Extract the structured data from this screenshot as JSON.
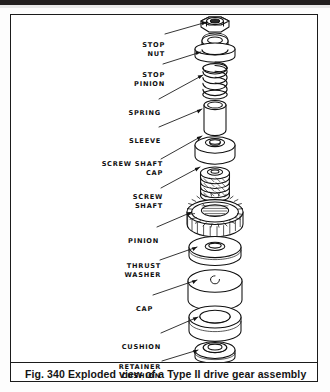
{
  "figure": {
    "caption": "Fig. 340  Exploded view of a Type II drive gear assembly",
    "caption_number": "Fig. 340",
    "caption_text": "Exploded view of a Type II drive gear assembly",
    "border_color": "#1b1b1b",
    "ink_color": "#101010",
    "page_background": "#ffffff",
    "scan_band_color": "#221f1f"
  },
  "callouts": [
    {
      "id": "stop-nut",
      "label": "STOP\nNUT",
      "lines": [
        "STOP",
        "NUT"
      ],
      "label_x": 112,
      "label_y": 14,
      "leader_from_x": 152,
      "leader_from_y": 19,
      "leader_to_x": 196,
      "leader_to_y": 8
    },
    {
      "id": "stop-pinion",
      "label": "STOP\nPINION",
      "lines": [
        "STOP",
        "PINION"
      ],
      "label_x": 104,
      "label_y": 44,
      "leader_from_x": 152,
      "leader_from_y": 49,
      "leader_to_x": 190,
      "leader_to_y": 37
    },
    {
      "id": "spring",
      "label": "SPRING",
      "lines": [
        "SPRING"
      ],
      "label_x": 119,
      "label_y": 83,
      "leader_from_x": 152,
      "leader_from_y": 84,
      "leader_to_x": 192,
      "leader_to_y": 59
    },
    {
      "id": "sleeve",
      "label": "SLEEVE",
      "lines": [
        "SLEEVE"
      ],
      "label_x": 119,
      "label_y": 111,
      "leader_from_x": 152,
      "leader_from_y": 112,
      "leader_to_x": 190,
      "leader_to_y": 93
    },
    {
      "id": "screw-shaft-cap",
      "label": "SCREW  SHAFT\nCAP",
      "lines": [
        "SCREW  SHAFT",
        "CAP"
      ],
      "label_x": 92,
      "label_y": 130,
      "leader_from_x": 152,
      "leader_from_y": 143,
      "leader_to_x": 190,
      "leader_to_y": 120
    },
    {
      "id": "screw-shaft",
      "label": "SCREW\nSHAFT",
      "lines": [
        "SCREW",
        "SHAFT"
      ],
      "label_x": 112,
      "label_y": 165,
      "leader_from_x": 152,
      "leader_from_y": 172,
      "leader_to_x": 188,
      "leader_to_y": 151
    },
    {
      "id": "pinion",
      "label": "PINION",
      "lines": [
        "PINION"
      ],
      "label_x": 119,
      "label_y": 211,
      "leader_from_x": 152,
      "leader_from_y": 212,
      "leader_to_x": 180,
      "leader_to_y": 196
    },
    {
      "id": "thrust-washer",
      "label": "THRUST\nWASHER",
      "lines": [
        "THRUST",
        "WASHER"
      ],
      "label_x": 110,
      "label_y": 236,
      "leader_from_x": 152,
      "leader_from_y": 244,
      "leader_to_x": 186,
      "leader_to_y": 231
    },
    {
      "id": "cap",
      "label": "CAP",
      "lines": [
        "CAP"
      ],
      "label_x": 131,
      "label_y": 279,
      "leader_from_x": 152,
      "leader_from_y": 280,
      "leader_to_x": 185,
      "leader_to_y": 264
    },
    {
      "id": "cushion",
      "label": "CUSHION",
      "lines": [
        "CUSHION"
      ],
      "label_x": 113,
      "label_y": 317,
      "leader_from_x": 152,
      "leader_from_y": 318,
      "leader_to_x": 186,
      "leader_to_y": 301
    },
    {
      "id": "retainer-cushion",
      "label": "RETAINER\nCUSHION",
      "lines": [
        "RETAINER",
        "CUSHION"
      ],
      "label_x": 108,
      "label_y": 337,
      "leader_from_x": 152,
      "leader_from_y": 346,
      "leader_to_x": 186,
      "leader_to_y": 334
    }
  ],
  "parts_order": [
    "STOP NUT",
    "STOP PINION",
    "SPRING",
    "SLEEVE",
    "SCREW SHAFT CAP",
    "SCREW SHAFT",
    "PINION",
    "THRUST WASHER",
    "CAP",
    "CUSHION",
    "RETAINER CUSHION"
  ]
}
